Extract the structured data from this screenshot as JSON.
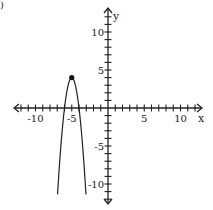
{
  "corner_mark": ")",
  "chart_data": {
    "type": "line",
    "title": "",
    "xlabel": "x",
    "ylabel": "y",
    "xlim": [
      -12,
      12
    ],
    "ylim": [
      -12,
      12
    ],
    "grid": false,
    "x_tick_labels": [
      "-10",
      "-5",
      "5",
      "10"
    ],
    "x_tick_values": [
      -10,
      -5,
      5,
      10
    ],
    "y_tick_labels": [
      "10",
      "5",
      "-5",
      "-10"
    ],
    "y_tick_values": [
      10,
      5,
      -5,
      -10
    ],
    "tick_step": 1,
    "series": [
      {
        "name": "parabola",
        "equation_estimate": "y = -4(x+5)^2 + 4",
        "vertex": [
          -5,
          4
        ],
        "opens": "down",
        "x": [
          -7,
          -6.75,
          -6.5,
          -6.25,
          -6,
          -5.75,
          -5.5,
          -5.25,
          -5,
          -4.75,
          -4.5,
          -4.25,
          -4,
          -3.75,
          -3.5,
          -3.25,
          -3
        ],
        "y": [
          -12,
          -8.25,
          -5,
          -2.25,
          0,
          1.75,
          3,
          3.75,
          4,
          3.75,
          3,
          1.75,
          0,
          -2.25,
          -5,
          -8.25,
          -12
        ]
      }
    ],
    "highlighted_points": [
      {
        "label": "vertex",
        "x": -5,
        "y": 4
      }
    ]
  }
}
